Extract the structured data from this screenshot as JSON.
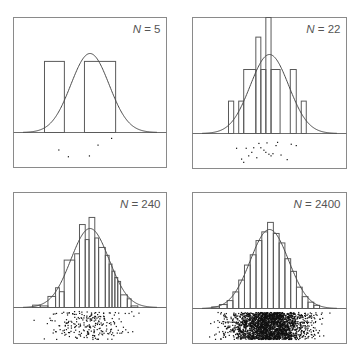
{
  "chart_data": [
    {
      "type": "bar",
      "panel": "top-left",
      "label": {
        "var": "N",
        "eq": " = ",
        "value": "5"
      },
      "n": 5,
      "x_range_sd": [
        -4,
        4
      ],
      "curve": {
        "type": "normal",
        "mean": 0,
        "sd": 1,
        "peak": 1.0
      },
      "bins_sd": [
        {
          "x0": -2.38,
          "x1": -1.34,
          "h": 0.9
        },
        {
          "x0": -1.34,
          "x1": -0.29,
          "h": 0.0
        },
        {
          "x0": -0.29,
          "x1": 1.34,
          "h": 0.9
        }
      ],
      "points": [
        {
          "x": -1.63,
          "y": 0.5
        },
        {
          "x": -1.13,
          "y": 0.75
        },
        {
          "x": -0.03,
          "y": 0.72
        },
        {
          "x": 0.42,
          "y": 0.32
        },
        {
          "x": 1.13,
          "y": 0.07
        }
      ]
    },
    {
      "type": "bar",
      "panel": "top-right",
      "label": {
        "var": "N",
        "eq": " = ",
        "value": "22"
      },
      "n": 22,
      "x_range_sd": [
        -4,
        4
      ],
      "curve": {
        "type": "normal",
        "mean": 0,
        "sd": 1,
        "peak": 1.0
      },
      "bins_sd": [
        {
          "x0": -2.13,
          "x1": -1.86,
          "h": 0.41
        },
        {
          "x0": -1.86,
          "x1": -1.6,
          "h": 0.0
        },
        {
          "x0": -1.6,
          "x1": -1.34,
          "h": 0.41
        },
        {
          "x0": -1.34,
          "x1": -0.71,
          "h": 0.81
        },
        {
          "x0": -0.71,
          "x1": -0.45,
          "h": 1.22
        },
        {
          "x0": -0.45,
          "x1": -0.19,
          "h": 0.81
        },
        {
          "x0": -0.19,
          "x1": 0.08,
          "h": 1.5
        },
        {
          "x0": 0.08,
          "x1": 0.55,
          "h": 0.81
        },
        {
          "x0": 0.55,
          "x1": 1.08,
          "h": 0.0
        },
        {
          "x0": 1.08,
          "x1": 1.39,
          "h": 0.81
        },
        {
          "x0": 1.39,
          "x1": 1.65,
          "h": 0.0
        },
        {
          "x0": 1.65,
          "x1": 1.91,
          "h": 0.41
        }
      ],
      "points": [
        {
          "x": -1.71,
          "y": 0.4
        },
        {
          "x": -1.21,
          "y": 0.4
        },
        {
          "x": -0.82,
          "y": 0.38
        },
        {
          "x": -0.92,
          "y": 0.55
        },
        {
          "x": -0.55,
          "y": 0.22
        },
        {
          "x": -0.13,
          "y": 0.2
        },
        {
          "x": 0.42,
          "y": 0.18
        },
        {
          "x": 1.13,
          "y": 0.25
        },
        {
          "x": 1.39,
          "y": 0.3
        },
        {
          "x": -0.45,
          "y": 0.38
        },
        {
          "x": -0.29,
          "y": 0.47
        },
        {
          "x": -0.19,
          "y": 0.55
        },
        {
          "x": -0.03,
          "y": 0.62
        },
        {
          "x": 0.08,
          "y": 0.68
        },
        {
          "x": 0.18,
          "y": 0.6
        },
        {
          "x": -0.66,
          "y": 0.75
        },
        {
          "x": -1.08,
          "y": 0.68
        },
        {
          "x": 0.6,
          "y": 0.65
        },
        {
          "x": 0.34,
          "y": 0.3
        },
        {
          "x": -1.45,
          "y": 0.8
        },
        {
          "x": -1.34,
          "y": 0.92
        },
        {
          "x": 0.92,
          "y": 0.82
        }
      ]
    },
    {
      "type": "bar",
      "panel": "bottom-left",
      "label": {
        "var": "N",
        "eq": " = ",
        "value": "240"
      },
      "n": 240,
      "x_range_sd": [
        -4,
        4
      ],
      "curve": {
        "type": "normal",
        "mean": 0,
        "sd": 1,
        "peak": 1.0
      },
      "bins_sd": [
        {
          "x0": -3.0,
          "x1": -2.6,
          "h": 0.03
        },
        {
          "x0": -2.6,
          "x1": -2.2,
          "h": 0.02
        },
        {
          "x0": -2.2,
          "x1": -1.8,
          "h": 0.14
        },
        {
          "x0": -1.8,
          "x1": -1.6,
          "h": 0.25
        },
        {
          "x0": -1.6,
          "x1": -1.35,
          "h": 0.2
        },
        {
          "x0": -1.35,
          "x1": -0.8,
          "h": 0.6
        },
        {
          "x0": -0.8,
          "x1": -0.55,
          "h": 0.68
        },
        {
          "x0": -0.55,
          "x1": -0.25,
          "h": 1.05
        },
        {
          "x0": -0.25,
          "x1": -0.05,
          "h": 0.86
        },
        {
          "x0": -0.05,
          "x1": 0.25,
          "h": 1.14
        },
        {
          "x0": 0.25,
          "x1": 0.45,
          "h": 0.88
        },
        {
          "x0": 0.45,
          "x1": 0.8,
          "h": 0.76
        },
        {
          "x0": 0.8,
          "x1": 1.0,
          "h": 0.66
        },
        {
          "x0": 1.0,
          "x1": 1.15,
          "h": 0.55
        },
        {
          "x0": 1.15,
          "x1": 1.3,
          "h": 0.46
        },
        {
          "x0": 1.3,
          "x1": 1.45,
          "h": 0.38
        },
        {
          "x0": 1.45,
          "x1": 1.6,
          "h": 0.33
        },
        {
          "x0": 1.6,
          "x1": 1.95,
          "h": 0.16
        },
        {
          "x0": 1.95,
          "x1": 2.15,
          "h": 0.11
        },
        {
          "x0": 2.15,
          "x1": 2.5,
          "h": 0.02
        }
      ],
      "points_distribution": {
        "type": "normal",
        "mean": 0,
        "sd": 1,
        "count": 240,
        "seed": 240
      }
    },
    {
      "type": "bar",
      "panel": "bottom-right",
      "label": {
        "var": "N",
        "eq": " = ",
        "value": "2400"
      },
      "n": 2400,
      "x_range_sd": [
        -4,
        4
      ],
      "curve": {
        "type": "normal",
        "mean": 0,
        "sd": 1,
        "peak": 1.0
      },
      "bins_sd": [
        {
          "x0": -3.0,
          "x1": -2.6,
          "h": 0.02
        },
        {
          "x0": -2.6,
          "x1": -2.2,
          "h": 0.05
        },
        {
          "x0": -2.2,
          "x1": -1.9,
          "h": 0.1
        },
        {
          "x0": -1.9,
          "x1": -1.6,
          "h": 0.21
        },
        {
          "x0": -1.6,
          "x1": -1.3,
          "h": 0.36
        },
        {
          "x0": -1.3,
          "x1": -1.0,
          "h": 0.55
        },
        {
          "x0": -1.0,
          "x1": -0.7,
          "h": 0.68
        },
        {
          "x0": -0.7,
          "x1": -0.4,
          "h": 0.86
        },
        {
          "x0": -0.4,
          "x1": -0.1,
          "h": 0.97
        },
        {
          "x0": -0.1,
          "x1": 0.2,
          "h": 1.09
        },
        {
          "x0": 0.2,
          "x1": 0.5,
          "h": 0.95
        },
        {
          "x0": 0.5,
          "x1": 0.8,
          "h": 0.83
        },
        {
          "x0": 0.8,
          "x1": 1.1,
          "h": 0.63
        },
        {
          "x0": 1.1,
          "x1": 1.4,
          "h": 0.47
        },
        {
          "x0": 1.4,
          "x1": 1.7,
          "h": 0.27
        },
        {
          "x0": 1.7,
          "x1": 2.0,
          "h": 0.15
        },
        {
          "x0": 2.0,
          "x1": 2.3,
          "h": 0.08
        },
        {
          "x0": 2.3,
          "x1": 2.6,
          "h": 0.04
        }
      ],
      "points_distribution": {
        "type": "normal",
        "mean": 0,
        "sd": 1,
        "count": 2400,
        "seed": 2400
      }
    }
  ]
}
